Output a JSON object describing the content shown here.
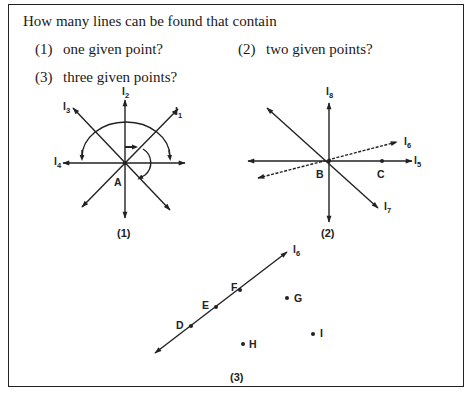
{
  "question": {
    "stem": "How many lines can be found that contain",
    "parts": [
      {
        "num": "(1)",
        "text": "one given point?"
      },
      {
        "num": "(2)",
        "text": "two given points?"
      },
      {
        "num": "(3)",
        "text": "three given points?"
      }
    ]
  },
  "figures": [
    {
      "caption": "(1)",
      "point": "A",
      "lines": [
        "l1",
        "l2",
        "l3",
        "l4"
      ]
    },
    {
      "caption": "(2)",
      "points": [
        "B",
        "C"
      ],
      "lines": [
        "l5",
        "l6",
        "l7",
        "l8"
      ]
    },
    {
      "caption": "(3)",
      "line": "l6",
      "collinear_points": [
        "D",
        "E",
        "F"
      ],
      "other_points": [
        "G",
        "H",
        "I"
      ]
    }
  ],
  "labels": {
    "A": "A",
    "B": "B",
    "C": "C",
    "D": "D",
    "E": "E",
    "F": "F",
    "G": "G",
    "H": "H",
    "I": "I",
    "l": "l",
    "sub1": "1",
    "sub2": "2",
    "sub3": "3",
    "sub4": "4",
    "sub5": "5",
    "sub6": "6",
    "sub7": "7",
    "sub8": "8",
    "cap1": "(1)",
    "cap2": "(2)",
    "cap3": "(3)"
  }
}
